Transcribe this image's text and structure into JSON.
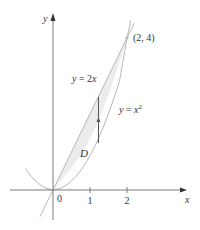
{
  "figure": {
    "axes": {
      "x_label": "x",
      "y_label": "y",
      "origin_label": "0",
      "x_ticks": [
        {
          "value": 1,
          "label": "1"
        },
        {
          "value": 2,
          "label": "2"
        }
      ]
    },
    "curves": [
      {
        "name": "line",
        "equation_prefix": "y = 2",
        "equation_var": "x"
      },
      {
        "name": "parabola",
        "equation_prefix": "y = ",
        "equation_var": "x",
        "exponent": "2"
      }
    ],
    "intersection_point": {
      "label": "(2, 4)",
      "x": 2,
      "y": 4
    },
    "region": {
      "label": "D",
      "fill": "#e8e8e8"
    },
    "colors": {
      "axis": "#7a7a7a",
      "curve": "#b8b8b8",
      "text": "#333333",
      "arrow": "#555555"
    }
  }
}
